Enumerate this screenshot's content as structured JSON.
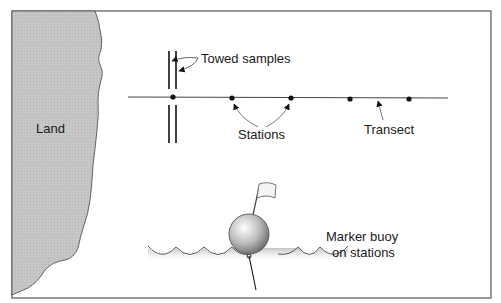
{
  "labels": {
    "land": "Land",
    "towed_samples": "Towed samples",
    "stations": "Stations",
    "transect": "Transect",
    "marker_buoy_line1": "Marker buoy",
    "marker_buoy_line2": "on stations"
  },
  "colors": {
    "land_fill": "#c4c4c4",
    "frame": "#555555",
    "line": "#333333",
    "text": "#1a1a1a"
  }
}
